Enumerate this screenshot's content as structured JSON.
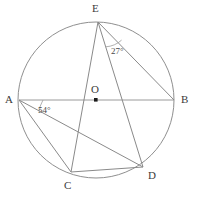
{
  "figure": {
    "type": "circle-geometry-diagram",
    "background_color": "#ffffff",
    "stroke_color": "#8c8c8c",
    "label_color": "#3b3b3b",
    "width": 197,
    "height": 197
  },
  "circle": {
    "name": "circumscribed-circle",
    "center_label": "O",
    "center_x": 96,
    "center_y": 100,
    "radius": 78
  },
  "points": [
    {
      "id": "A",
      "label": "A",
      "x": 19,
      "y": 100,
      "label_x": 5,
      "label_y": 94
    },
    {
      "id": "B",
      "label": "B",
      "x": 174,
      "y": 100,
      "label_x": 181,
      "label_y": 94
    },
    {
      "id": "C",
      "label": "C",
      "x": 71,
      "y": 172,
      "label_x": 64,
      "label_y": 180
    },
    {
      "id": "D",
      "label": "D",
      "x": 143,
      "y": 167,
      "label_x": 148,
      "label_y": 170
    },
    {
      "id": "E",
      "label": "E",
      "x": 98,
      "y": 22,
      "label_x": 92,
      "label_y": 3
    },
    {
      "id": "O",
      "label": "O",
      "x": 96,
      "y": 100,
      "label_x": 91,
      "label_y": 84
    }
  ],
  "segments": [
    {
      "name": "segment-AB",
      "from": "A",
      "to": "B"
    },
    {
      "name": "segment-AC",
      "from": "A",
      "to": "C"
    },
    {
      "name": "segment-AD",
      "from": "A",
      "to": "D"
    },
    {
      "name": "segment-CD",
      "from": "C",
      "to": "D"
    },
    {
      "name": "segment-EB",
      "from": "E",
      "to": "B"
    },
    {
      "name": "segment-ED",
      "from": "E",
      "to": "D"
    },
    {
      "name": "segment-EC",
      "from": "E",
      "to": "C"
    }
  ],
  "angles": [
    {
      "name": "angle-at-E",
      "vertex": "E",
      "value": "27°",
      "label_x": 111,
      "label_y": 47,
      "arc_radius": 26,
      "between": [
        "ED",
        "EB"
      ]
    },
    {
      "name": "angle-at-A",
      "vertex": "A",
      "value": "54°",
      "label_x": 38,
      "label_y": 106,
      "arc_radius": 24,
      "between": [
        "AB",
        "AD"
      ]
    }
  ]
}
